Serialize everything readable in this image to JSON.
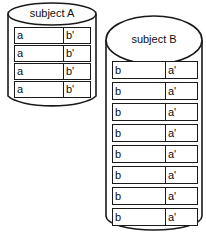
{
  "diagram": {
    "type": "database-cylinders",
    "background_color": "#ffffff",
    "stroke_color": "#1a1a1a",
    "text_color": "#0d0d0d",
    "cylinders": [
      {
        "id": "subject-a",
        "title": "subject A",
        "row_count": 4,
        "columns": [
          "left",
          "right"
        ],
        "rows": [
          {
            "left": "a",
            "right": "b'"
          },
          {
            "left": "a",
            "right": "b'"
          },
          {
            "left": "a",
            "right": "b'"
          },
          {
            "left": "a",
            "right": "b'"
          }
        ]
      },
      {
        "id": "subject-b",
        "title": "subject B",
        "row_count": 8,
        "columns": [
          "left",
          "right"
        ],
        "rows": [
          {
            "left": "b",
            "right": "a'"
          },
          {
            "left": "b",
            "right": "a'"
          },
          {
            "left": "b",
            "right": "a'"
          },
          {
            "left": "b",
            "right": "a'"
          },
          {
            "left": "b",
            "right": "a'"
          },
          {
            "left": "b",
            "right": "a'"
          },
          {
            "left": "b",
            "right": "a'"
          },
          {
            "left": "b",
            "right": "a'"
          }
        ]
      }
    ]
  }
}
